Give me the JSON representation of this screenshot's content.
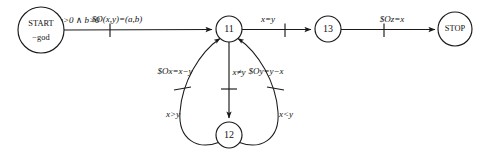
{
  "diagram": {
    "type": "state-transition-diagram",
    "title": "",
    "background_color": "#ffffff",
    "stroke_color": "#1a1a1a",
    "nodes": [
      {
        "id": "start",
        "label_line1": "START",
        "label_line2": "−god",
        "cx": 41,
        "cy": 30,
        "r": 23
      },
      {
        "id": "s11",
        "label": "11",
        "cx": 229,
        "cy": 29,
        "r": 13
      },
      {
        "id": "s13",
        "label": "13",
        "cx": 328,
        "cy": 29,
        "r": 13
      },
      {
        "id": "stop",
        "label": "STOP",
        "cx": 455,
        "cy": 29,
        "r": 17
      },
      {
        "id": "s12",
        "label": "12",
        "cx": 229,
        "cy": 135,
        "r": 13
      }
    ],
    "edges": [
      {
        "id": "start-to-11",
        "from": "start",
        "to": "s11",
        "guard": "a>0 ∧ b>0",
        "action": "$O(x,y)=(a,b)"
      },
      {
        "id": "11-to-13",
        "from": "s11",
        "to": "s13",
        "guard": "x=y",
        "action": ""
      },
      {
        "id": "13-to-stop",
        "from": "s13",
        "to": "stop",
        "guard": "",
        "action": "$Oz=x"
      },
      {
        "id": "11-to-12-middle",
        "from": "s11",
        "to": "s12",
        "guard": "x≠y",
        "action": ""
      },
      {
        "id": "12-to-11-left",
        "from": "s12",
        "to": "s11",
        "guard": "x>y",
        "action": "$Ox=x−y"
      },
      {
        "id": "12-to-11-right",
        "from": "s12",
        "to": "s11",
        "guard": "x<y",
        "action": "$Oy=y−x"
      }
    ],
    "labels": {
      "start_line1": "START",
      "start_line2": "−god",
      "stop": "STOP",
      "node_11": "11",
      "node_12": "12",
      "node_13": "13",
      "guard_start": "a>0 ∧ b>0",
      "action_start": "$O(x,y)=(a,b)",
      "guard_xeqy": "x=y",
      "action_z": "$Oz=x",
      "action_x_minus_y": "$Ox=x−y",
      "guard_xney": "x≠y",
      "action_y_minus_x": "$Oy=y−x",
      "guard_xgty": "x>y",
      "guard_xlty": "x<y"
    }
  }
}
